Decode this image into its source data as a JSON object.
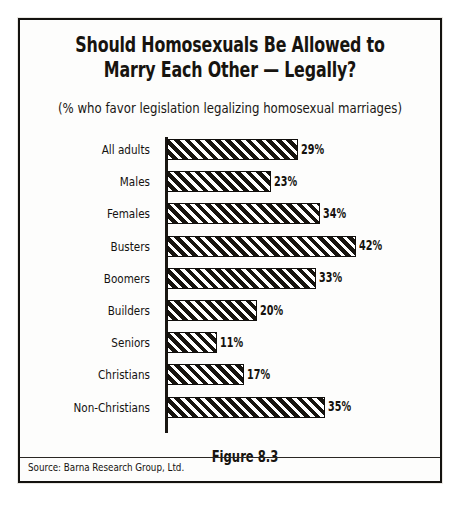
{
  "chart_data": {
    "type": "bar",
    "orientation": "horizontal",
    "title": "Should Homosexuals Be Allowed to Marry Each Other — Legally?",
    "title_lines": [
      "Should Homosexuals Be Allowed to",
      "Marry Each Other — Legally?"
    ],
    "subtitle": "(% who favor legislation legalizing homosexual marriages)",
    "categories": [
      "All adults",
      "Males",
      "Females",
      "Busters",
      "Boomers",
      "Builders",
      "Seniors",
      "Christians",
      "Non-Christians"
    ],
    "values": [
      29,
      23,
      34,
      42,
      33,
      20,
      11,
      17,
      35
    ],
    "value_labels": [
      "29%",
      "23%",
      "34%",
      "42%",
      "33%",
      "20%",
      "11%",
      "17%",
      "35%"
    ],
    "xlabel": "",
    "ylabel": "",
    "xlim": [
      0,
      45
    ],
    "grid": false,
    "legend": null,
    "bar_fill": "diagonal-hatch",
    "bar_color": "#17140f",
    "figure_caption": "Figure 8.3",
    "source_note": "Source: Barna Research Group, Ltd."
  },
  "colors": {
    "background": "#fdfdfc",
    "ink": "#17140f",
    "frame": "#14120f"
  }
}
